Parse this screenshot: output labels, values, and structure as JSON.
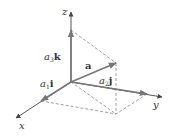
{
  "diagram": {
    "type": "3d-vector-decomposition",
    "colors": {
      "axis": "#555555",
      "vector": "#777777",
      "dashed": "#888888",
      "text": "#333333"
    },
    "points": {
      "origin": [
        71,
        82
      ],
      "z_axis_end": [
        71,
        12
      ],
      "x_axis_end": [
        16,
        118
      ],
      "y_axis_end": [
        162,
        97
      ],
      "a3k_tip": [
        71,
        30
      ],
      "a1i_tip": [
        41,
        101
      ],
      "a2j_tip": [
        147,
        94
      ],
      "a_tip": [
        116,
        63
      ],
      "base_point": [
        116,
        114
      ]
    },
    "labels": {
      "z": "z",
      "x": "x",
      "y": "y",
      "a": "a",
      "a3k": {
        "coef": "a",
        "sub": "3",
        "unit": "k"
      },
      "a1i": {
        "coef": "a",
        "sub": "1",
        "unit": "i"
      },
      "a2j": {
        "coef": "a",
        "sub": "2",
        "unit": "j"
      }
    }
  }
}
